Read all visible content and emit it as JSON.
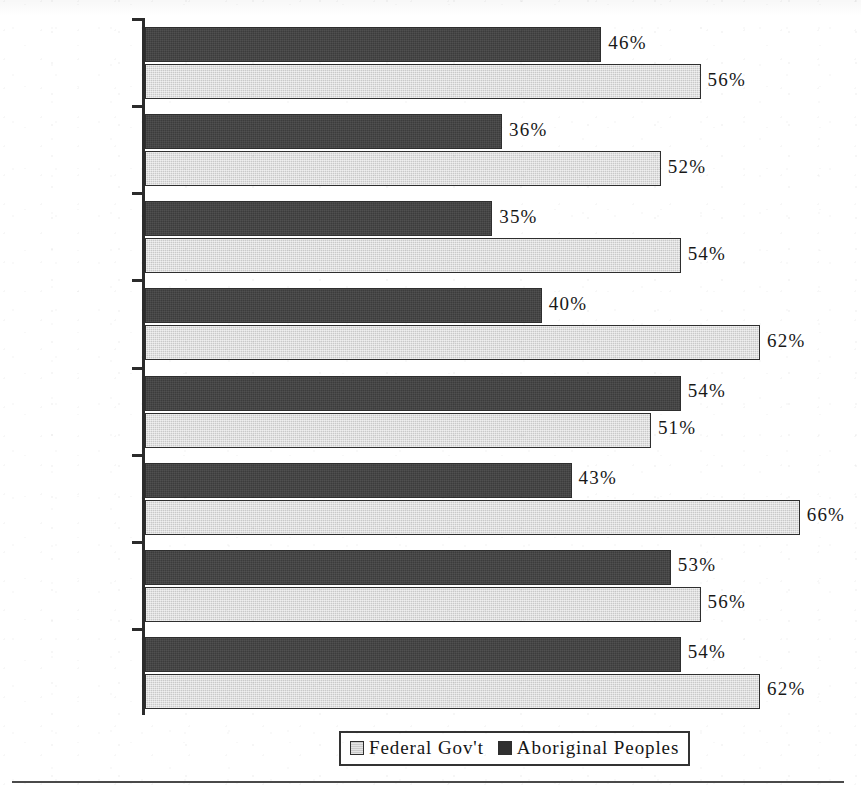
{
  "chart_data": {
    "type": "bar",
    "orientation": "horizontal",
    "title": "",
    "subtitle": "",
    "xlabel": "",
    "ylabel": "",
    "xlim": [
      0,
      70
    ],
    "grid": false,
    "legend_position": "bottom-center",
    "value_suffix": "%",
    "categories": [
      "Canada",
      "BC",
      "Alberta",
      "Sask/Man",
      "Ontario",
      "Quebec",
      "Atlantic",
      "Yukon/NWT"
    ],
    "series": [
      {
        "name": "Aboriginal Peoples",
        "color": "#3c3c3c",
        "values": [
          46,
          36,
          35,
          40,
          54,
          43,
          53,
          54
        ],
        "labels": [
          "46%",
          "36%",
          "35%",
          "40%",
          "54%",
          "43%",
          "53%",
          "54%"
        ]
      },
      {
        "name": "Federal Gov't",
        "color": "#c9c9c9",
        "values": [
          56,
          52,
          54,
          62,
          51,
          66,
          56,
          62
        ],
        "labels": [
          "56%",
          "52%",
          "54%",
          "62%",
          "51%",
          "66%",
          "56%",
          "62%"
        ]
      }
    ]
  },
  "legend": {
    "entries": [
      {
        "label": "Federal Gov't",
        "swatch": "light"
      },
      {
        "label": "Aboriginal Peoples",
        "swatch": "dark"
      }
    ]
  },
  "colors": {
    "series_dark": "#3c3c3c",
    "series_light": "#c9c9c9",
    "axis": "#2b2b2b",
    "text": "#1c1c1c",
    "background": "#ffffff"
  }
}
